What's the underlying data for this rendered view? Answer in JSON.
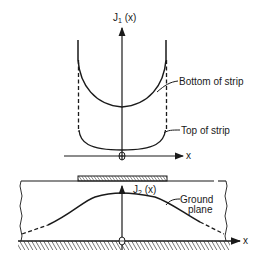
{
  "upper_plot": {
    "y_axis_label": "J",
    "y_axis_subscript": "1",
    "y_axis_arg": " (x)",
    "x_axis_label": "x",
    "curves": [
      {
        "name": "Bottom of strip",
        "style": "solid"
      },
      {
        "name": "Top of strip",
        "style": "solid"
      }
    ],
    "annotation_bottom": "Bottom of strip",
    "annotation_top": "Top of strip"
  },
  "lower_plot": {
    "y_axis_label": "J",
    "y_axis_subscript": "2",
    "y_axis_arg": " (x)",
    "x_axis_label": "x",
    "annotation_line1": "Ground",
    "annotation_line2": "plane"
  },
  "colors": {
    "ink": "#1a1a1a",
    "background": "#ffffff"
  }
}
